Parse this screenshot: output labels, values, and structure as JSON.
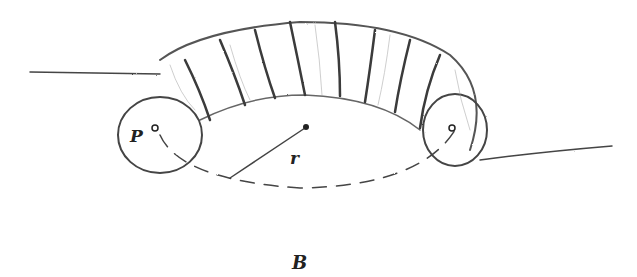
{
  "figure": {
    "labels": {
      "point": "P",
      "radius": "r",
      "field": "B"
    },
    "colors": {
      "ink": "#333333",
      "shade": "#777777",
      "background": "#ffffff"
    }
  }
}
